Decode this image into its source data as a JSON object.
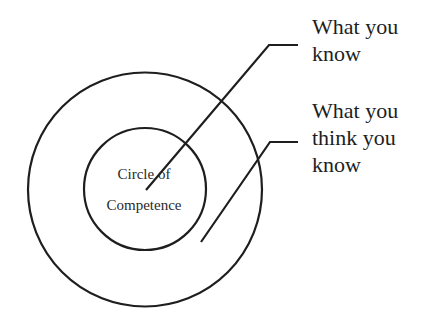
{
  "diagram": {
    "inner_circle": {
      "label_lines": [
        "Circle of",
        "Competence"
      ],
      "center": [
        145,
        189
      ],
      "radius": 61
    },
    "outer_circle": {
      "center": [
        145,
        189.5
      ],
      "radius": 117
    },
    "callouts": [
      {
        "label_lines": [
          "What you",
          "know"
        ],
        "points_to": "inner_circle",
        "line": [
          [
            146,
            190
          ],
          [
            269,
            45
          ],
          [
            298,
            45
          ]
        ]
      },
      {
        "label_lines": [
          "What you",
          "think you",
          "know"
        ],
        "points_to": "outer_ring",
        "line": [
          [
            201,
            242
          ],
          [
            270,
            142
          ],
          [
            298,
            142
          ]
        ]
      }
    ],
    "stroke_color": "#1e1e1e",
    "background_color": "#ffffff"
  }
}
